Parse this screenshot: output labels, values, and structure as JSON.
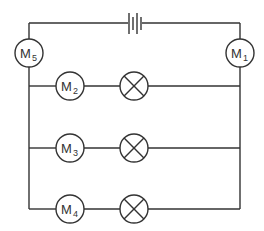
{
  "diagram": {
    "type": "circuit",
    "colors": {
      "line": "#333333",
      "background": "#ffffff"
    },
    "battery": {
      "label": "",
      "position": "top-wire"
    },
    "meters": [
      {
        "id": "M1",
        "letter": "M",
        "sub": "1",
        "position": "right-wire"
      },
      {
        "id": "M2",
        "letter": "M",
        "sub": "2",
        "position": "branch-1"
      },
      {
        "id": "M3",
        "letter": "M",
        "sub": "3",
        "position": "branch-2"
      },
      {
        "id": "M4",
        "letter": "M",
        "sub": "4",
        "position": "branch-3"
      },
      {
        "id": "M5",
        "letter": "M",
        "sub": "5",
        "position": "left-wire"
      }
    ],
    "lamps": [
      {
        "id": "lamp-1",
        "branch": 1
      },
      {
        "id": "lamp-2",
        "branch": 2
      },
      {
        "id": "lamp-3",
        "branch": 3
      }
    ],
    "branches": 3
  }
}
